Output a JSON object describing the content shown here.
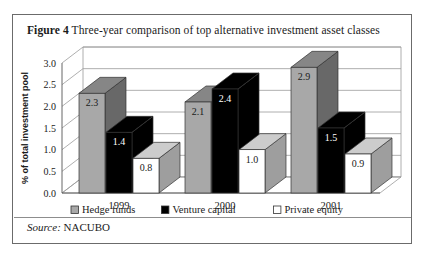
{
  "figure": {
    "label": "Figure 4",
    "title": "Three-year comparison of top alternative investment asset classes",
    "source_label": "Source:",
    "source_value": "NACUBO"
  },
  "chart_data": {
    "type": "bar",
    "title": "Three-year comparison of top alternative investment asset classes",
    "xlabel": "",
    "ylabel": "% of total investment pool",
    "categories": [
      "1999",
      "2000",
      "2001"
    ],
    "series": [
      {
        "name": "Hedge funds",
        "values": [
          2.3,
          2.1,
          2.9
        ],
        "color": "#a8a8a8"
      },
      {
        "name": "Venture capital",
        "values": [
          1.4,
          2.4,
          1.5
        ],
        "color": "#000000"
      },
      {
        "name": "Private equity",
        "values": [
          0.8,
          1.0,
          0.9
        ],
        "color": "#ffffff"
      }
    ],
    "ylim": [
      0.0,
      3.0
    ],
    "yticks": [
      "0.0",
      "0.5",
      "1.0",
      "1.5",
      "2.0",
      "2.5",
      "3.0"
    ],
    "grid": true,
    "legend_position": "bottom",
    "projection": "3d",
    "data_labels": true
  },
  "legend": {
    "items": [
      {
        "label": "Hedge funds",
        "swatch": "#a8a8a8"
      },
      {
        "label": "Venture capital",
        "swatch": "#000000"
      },
      {
        "label": "Private equity",
        "swatch": "#ffffff"
      }
    ]
  }
}
